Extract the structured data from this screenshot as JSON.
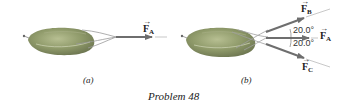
{
  "figure": {
    "caption": "Problem 48",
    "panels": [
      {
        "id": "a",
        "label": "(a)",
        "forces": [
          {
            "name": "F",
            "sub": "A",
            "arrow": "→"
          }
        ]
      },
      {
        "id": "b",
        "label": "(b)",
        "forces": [
          {
            "name": "F",
            "sub": "B",
            "arrow": "→"
          },
          {
            "name": "F",
            "sub": "A",
            "arrow": "→"
          },
          {
            "name": "F",
            "sub": "C",
            "arrow": "→"
          }
        ],
        "angles": [
          "20.0°",
          "20.0°"
        ]
      }
    ]
  },
  "colors": {
    "body_fill": "#8f9a6a",
    "body_shade": "#6f7850",
    "rope": "#9a9a9a",
    "arrow": "#6e6e6e",
    "line": "#b0b0b0",
    "text": "#222222"
  }
}
